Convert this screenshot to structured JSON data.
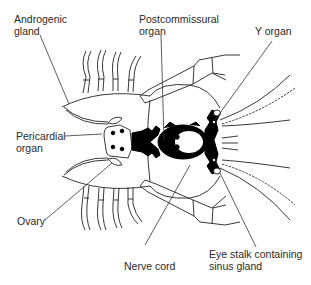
{
  "diagram": {
    "labels": {
      "androgenic_gland": [
        "Androgenic",
        "gland"
      ],
      "postcommissural_organ": [
        "Postcommissural",
        "organ"
      ],
      "y_organ": [
        "Y organ"
      ],
      "pericardial_organ": [
        "Pericardial",
        "organ"
      ],
      "ovary": [
        "Ovary"
      ],
      "nerve_cord": [
        "Nerve cord"
      ],
      "eye_stalk": [
        "Eye stalk containing",
        "sinus gland"
      ]
    },
    "colors": {
      "ink": "#000000",
      "text": "#2a2a2a",
      "background": "#ffffff"
    }
  }
}
